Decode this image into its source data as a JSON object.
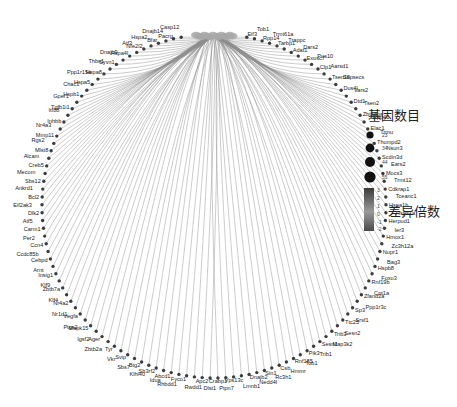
{
  "diagram": {
    "type": "gene-concept network (circular)",
    "hub_label": "",
    "genes_clockwise_from_top": [
      "Eif3",
      "Tob1",
      "Rpp14",
      "Trmt61a",
      "Tarbp1",
      "Trappc",
      "Adat1",
      "Dars2",
      "Exosc7",
      "Pus10",
      "Clp1",
      "Aarsd1",
      "Tsen15",
      "Sepsecs",
      "Dus4l",
      "Vars2",
      "Dtd1",
      "Tsen2",
      "Zbtb8os",
      "Rpp40",
      "Elac1",
      "Trmu",
      "Thumpd2",
      "Nsun3",
      "Scdin3d",
      "Ears2",
      "Mocs3",
      "Trmt12",
      "Cdkrap1",
      "Tceanc1",
      "Hspa1b",
      "Hspa1a",
      "Herpud1",
      "Ier3",
      "Hmox1",
      "Zc3h12a",
      "Nupr1",
      "Bag3",
      "Hspb8",
      "Foxo3",
      "Rnf19b",
      "Cpt1a",
      "Zfand2a",
      "Ppp1r3c",
      "Sp3",
      "Srsf1",
      "Ttc25",
      "Sesn2",
      "Trib3",
      "Map3k2",
      "Sesn1",
      "Trib1",
      "Pik3",
      "Tob1",
      "Rnf185",
      "Hmmr",
      "Csb",
      "Rc3h1",
      "Sin1",
      "Nedd4l",
      "Dnajb2",
      "Lmnb1",
      "Vps13c",
      "Ptpn7",
      "Crabp1",
      "Dlst1",
      "Apc2",
      "Rwdd1",
      "Fyco1",
      "Rhbdd1",
      "Abcd1",
      "Idua",
      "Sh3rf2",
      "Klhl40",
      "Btg2",
      "Sbs7",
      "Svip",
      "Vkr",
      "Tyr",
      "Zbtb2a",
      "Ager",
      "Igsf2",
      "Mapk15",
      "Ptgs2",
      "Vegfa",
      "Nr1d1",
      "Nr4a2",
      "Klf4",
      "Zbtb7a",
      "Klf9",
      "Insig1",
      "Arnt",
      "Cebpd",
      "Ccdc85b",
      "Ccn4",
      "Per2",
      "Carm1",
      "Atf5",
      "Dlk2",
      "Eif2ak3",
      "Bcl2",
      "Ankrd1",
      "Sbs12",
      "Mecom",
      "Creb5",
      "Alcam",
      "Mlst8",
      "Rgs2",
      "Mmp11",
      "Nr4a3",
      "Inhbb",
      "Itf88",
      "Tgfb1i1",
      "Gper1",
      "Hspb1",
      "Chac1",
      "Hspa5",
      "Ppp1r15a",
      "Hspa8",
      "Thbs1",
      "Syvn1",
      "Dnajb9",
      "Hspa4l",
      "Atf3",
      "Nfe2l2",
      "Hspa2",
      "Bfar",
      "Dnajb14",
      "Pacrg",
      "Casp12"
    ]
  },
  "legend_size": {
    "title": "基因数目",
    "values": [
      "23",
      "34",
      "44",
      "55"
    ]
  },
  "legend_color": {
    "title": "差异倍数",
    "ticks": [
      "3",
      "2",
      "1",
      "0",
      "-1",
      "-2"
    ],
    "range": [
      -2,
      3
    ],
    "colors": {
      "high": "#3a3a3a",
      "mid": "#9a9a9a",
      "low": "#4a4a4a"
    }
  },
  "colors": {
    "edge": "#8c8c8c",
    "hub": "#a8a8a8",
    "node": "#3c3c3c"
  }
}
